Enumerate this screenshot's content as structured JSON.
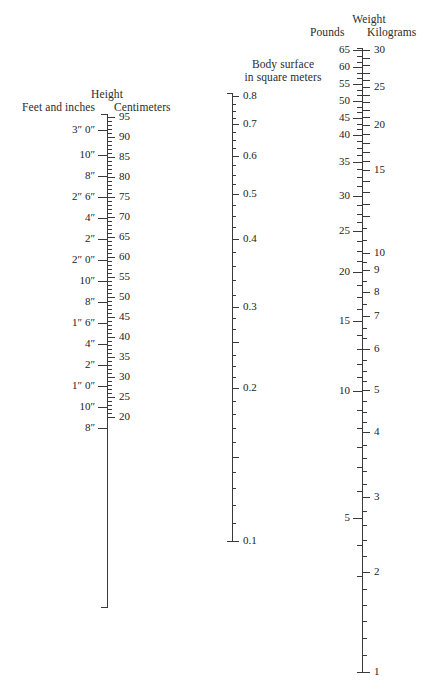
{
  "figure": {
    "kind": "nomogram",
    "name": "body-surface-area-nomogram"
  },
  "height_scale": {
    "title": "Height",
    "left_subtitle": "Feet and inches",
    "right_subtitle": "Centimeters",
    "axis": {
      "x": 107,
      "y_top": 114,
      "y_bottom": 607
    },
    "cm_ticks": [
      {
        "value": "95",
        "y": 117,
        "major": true
      },
      {
        "value": "",
        "y": 121,
        "major": false
      },
      {
        "value": "",
        "y": 125,
        "major": false
      },
      {
        "value": "",
        "y": 129,
        "major": false
      },
      {
        "value": "",
        "y": 133,
        "major": false
      },
      {
        "value": "90",
        "y": 137,
        "major": true
      },
      {
        "value": "",
        "y": 141,
        "major": false
      },
      {
        "value": "",
        "y": 145,
        "major": false
      },
      {
        "value": "",
        "y": 149,
        "major": false
      },
      {
        "value": "",
        "y": 153,
        "major": false
      },
      {
        "value": "85",
        "y": 157,
        "major": true
      },
      {
        "value": "",
        "y": 161,
        "major": false
      },
      {
        "value": "",
        "y": 165,
        "major": false
      },
      {
        "value": "",
        "y": 169,
        "major": false
      },
      {
        "value": "",
        "y": 173,
        "major": false
      },
      {
        "value": "80",
        "y": 177,
        "major": true
      },
      {
        "value": "",
        "y": 181,
        "major": false
      },
      {
        "value": "",
        "y": 185,
        "major": false
      },
      {
        "value": "",
        "y": 189,
        "major": false
      },
      {
        "value": "",
        "y": 193,
        "major": false
      },
      {
        "value": "75",
        "y": 197,
        "major": true
      },
      {
        "value": "",
        "y": 201,
        "major": false
      },
      {
        "value": "",
        "y": 205,
        "major": false
      },
      {
        "value": "",
        "y": 209,
        "major": false
      },
      {
        "value": "",
        "y": 213,
        "major": false
      },
      {
        "value": "70",
        "y": 217,
        "major": true
      },
      {
        "value": "",
        "y": 221,
        "major": false
      },
      {
        "value": "",
        "y": 225,
        "major": false
      },
      {
        "value": "",
        "y": 229,
        "major": false
      },
      {
        "value": "",
        "y": 233,
        "major": false
      },
      {
        "value": "65",
        "y": 237,
        "major": true
      },
      {
        "value": "",
        "y": 241,
        "major": false
      },
      {
        "value": "",
        "y": 245,
        "major": false
      },
      {
        "value": "",
        "y": 249,
        "major": false
      },
      {
        "value": "",
        "y": 253,
        "major": false
      },
      {
        "value": "60",
        "y": 257,
        "major": true
      },
      {
        "value": "",
        "y": 261,
        "major": false
      },
      {
        "value": "",
        "y": 265,
        "major": false
      },
      {
        "value": "",
        "y": 269,
        "major": false
      },
      {
        "value": "",
        "y": 273,
        "major": false
      },
      {
        "value": "55",
        "y": 277,
        "major": true
      },
      {
        "value": "",
        "y": 281,
        "major": false
      },
      {
        "value": "",
        "y": 285,
        "major": false
      },
      {
        "value": "",
        "y": 289,
        "major": false
      },
      {
        "value": "",
        "y": 293,
        "major": false
      },
      {
        "value": "50",
        "y": 297,
        "major": true
      },
      {
        "value": "",
        "y": 301,
        "major": false
      },
      {
        "value": "",
        "y": 305,
        "major": false
      },
      {
        "value": "",
        "y": 309,
        "major": false
      },
      {
        "value": "",
        "y": 313,
        "major": false
      },
      {
        "value": "45",
        "y": 317,
        "major": true
      },
      {
        "value": "",
        "y": 321,
        "major": false
      },
      {
        "value": "",
        "y": 325,
        "major": false
      },
      {
        "value": "",
        "y": 329,
        "major": false
      },
      {
        "value": "",
        "y": 333,
        "major": false
      },
      {
        "value": "40",
        "y": 337,
        "major": true
      },
      {
        "value": "",
        "y": 341,
        "major": false
      },
      {
        "value": "",
        "y": 345,
        "major": false
      },
      {
        "value": "",
        "y": 349,
        "major": false
      },
      {
        "value": "",
        "y": 353,
        "major": false
      },
      {
        "value": "35",
        "y": 357,
        "major": true
      },
      {
        "value": "",
        "y": 361,
        "major": false
      },
      {
        "value": "",
        "y": 365,
        "major": false
      },
      {
        "value": "",
        "y": 369,
        "major": false
      },
      {
        "value": "",
        "y": 373,
        "major": false
      },
      {
        "value": "30",
        "y": 377,
        "major": true
      },
      {
        "value": "",
        "y": 381,
        "major": false
      },
      {
        "value": "",
        "y": 385,
        "major": false
      },
      {
        "value": "",
        "y": 389,
        "major": false
      },
      {
        "value": "",
        "y": 393,
        "major": false
      },
      {
        "value": "25",
        "y": 397,
        "major": true
      },
      {
        "value": "",
        "y": 401,
        "major": false
      },
      {
        "value": "",
        "y": 405,
        "major": false
      },
      {
        "value": "",
        "y": 409,
        "major": false
      },
      {
        "value": "",
        "y": 413,
        "major": false
      },
      {
        "value": "20",
        "y": 417,
        "major": true
      }
    ],
    "ft_ticks": [
      {
        "value": "3″ 0″",
        "y": 130
      },
      {
        "value": "10″",
        "y": 155
      },
      {
        "value": "8″",
        "y": 176
      },
      {
        "value": "2″ 6″",
        "y": 197
      },
      {
        "value": "4″",
        "y": 218
      },
      {
        "value": "2″",
        "y": 239
      },
      {
        "value": "2″ 0″",
        "y": 260
      },
      {
        "value": "10″",
        "y": 281
      },
      {
        "value": "8″",
        "y": 302
      },
      {
        "value": "1″ 6″",
        "y": 323
      },
      {
        "value": "4″",
        "y": 344
      },
      {
        "value": "2″",
        "y": 365
      },
      {
        "value": "1″ 0″",
        "y": 386
      },
      {
        "value": "10″",
        "y": 407
      },
      {
        "value": "8″",
        "y": 428
      }
    ]
  },
  "bsa_scale": {
    "title_line1": "Body surface",
    "title_line2": "in square meters",
    "axis": {
      "x": 232,
      "y_top": 93,
      "y_bottom": 541
    },
    "ticks": [
      {
        "value": "0.8",
        "y": 96,
        "major": true
      },
      {
        "value": "",
        "y": 104,
        "major": false
      },
      {
        "value": "",
        "y": 111,
        "major": false
      },
      {
        "value": "",
        "y": 118,
        "major": false
      },
      {
        "value": "0.7",
        "y": 124,
        "major": true
      },
      {
        "value": "",
        "y": 132,
        "major": false
      },
      {
        "value": "",
        "y": 140,
        "major": false
      },
      {
        "value": "",
        "y": 148,
        "major": false
      },
      {
        "value": "0.6",
        "y": 156,
        "major": true
      },
      {
        "value": "",
        "y": 165,
        "major": false
      },
      {
        "value": "",
        "y": 175,
        "major": false
      },
      {
        "value": "",
        "y": 184,
        "major": false
      },
      {
        "value": "0.5",
        "y": 194,
        "major": true
      },
      {
        "value": "",
        "y": 205,
        "major": false
      },
      {
        "value": "",
        "y": 216,
        "major": false
      },
      {
        "value": "",
        "y": 227,
        "major": false
      },
      {
        "value": "0.4",
        "y": 239,
        "major": true
      },
      {
        "value": "",
        "y": 252,
        "major": false
      },
      {
        "value": "",
        "y": 266,
        "major": false
      },
      {
        "value": "",
        "y": 280,
        "major": false
      },
      {
        "value": "",
        "y": 295,
        "major": false
      },
      {
        "value": "0.3",
        "y": 307,
        "major": true
      },
      {
        "value": "",
        "y": 318,
        "major": false
      },
      {
        "value": "",
        "y": 329,
        "major": false
      },
      {
        "value": "",
        "y": 342,
        "major": true
      },
      {
        "value": "",
        "y": 355,
        "major": false
      },
      {
        "value": "",
        "y": 366,
        "major": false
      },
      {
        "value": "",
        "y": 377,
        "major": false
      },
      {
        "value": "0.2",
        "y": 388,
        "major": true
      },
      {
        "value": "",
        "y": 401,
        "major": false
      },
      {
        "value": "",
        "y": 414,
        "major": false
      },
      {
        "value": "",
        "y": 428,
        "major": false
      },
      {
        "value": "",
        "y": 442,
        "major": false
      },
      {
        "value": "",
        "y": 457,
        "major": true
      },
      {
        "value": "",
        "y": 472,
        "major": false
      },
      {
        "value": "",
        "y": 488,
        "major": false
      },
      {
        "value": "",
        "y": 505,
        "major": false
      },
      {
        "value": "",
        "y": 523,
        "major": false
      },
      {
        "value": "0.1",
        "y": 541,
        "major": true
      }
    ]
  },
  "weight_scale": {
    "title": "Weight",
    "left_subtitle": "Pounds",
    "right_subtitle": "Kilograms",
    "axis": {
      "x": 362,
      "y_top": 48,
      "y_bottom": 672
    },
    "kg_ticks": [
      {
        "value": "30",
        "y": 50,
        "major": true
      },
      {
        "value": "",
        "y": 58,
        "major": false
      },
      {
        "value": "",
        "y": 65,
        "major": false
      },
      {
        "value": "",
        "y": 73,
        "major": false
      },
      {
        "value": "",
        "y": 80,
        "major": false
      },
      {
        "value": "25",
        "y": 87,
        "major": true
      },
      {
        "value": "",
        "y": 95,
        "major": false
      },
      {
        "value": "",
        "y": 102,
        "major": false
      },
      {
        "value": "",
        "y": 110,
        "major": false
      },
      {
        "value": "",
        "y": 117,
        "major": false
      },
      {
        "value": "20",
        "y": 125,
        "major": true
      },
      {
        "value": "",
        "y": 134,
        "major": false
      },
      {
        "value": "",
        "y": 143,
        "major": false
      },
      {
        "value": "",
        "y": 152,
        "major": false
      },
      {
        "value": "",
        "y": 161,
        "major": false
      },
      {
        "value": "15",
        "y": 170,
        "major": true
      },
      {
        "value": "",
        "y": 181,
        "major": false
      },
      {
        "value": "",
        "y": 192,
        "major": false
      },
      {
        "value": "",
        "y": 204,
        "major": false
      },
      {
        "value": "",
        "y": 216,
        "major": false
      },
      {
        "value": "10",
        "y": 253,
        "major": true
      },
      {
        "value": "9",
        "y": 270,
        "major": true
      },
      {
        "value": "8",
        "y": 292,
        "major": true
      },
      {
        "value": "7",
        "y": 316,
        "major": true
      },
      {
        "value": "6",
        "y": 349,
        "major": true
      },
      {
        "value": "5",
        "y": 390,
        "major": true
      },
      {
        "value": "4",
        "y": 432,
        "major": true
      },
      {
        "value": "3",
        "y": 497,
        "major": true
      },
      {
        "value": "2",
        "y": 572,
        "major": true
      },
      {
        "value": "1",
        "y": 672,
        "major": true
      }
    ],
    "kg_minor_ticks": [
      {
        "y": 228
      },
      {
        "y": 240
      },
      {
        "y": 262
      },
      {
        "y": 281
      },
      {
        "y": 304
      },
      {
        "y": 328
      },
      {
        "y": 338
      },
      {
        "y": 360
      },
      {
        "y": 371
      },
      {
        "y": 381
      },
      {
        "y": 401
      },
      {
        "y": 412
      },
      {
        "y": 422
      },
      {
        "y": 445
      },
      {
        "y": 458
      },
      {
        "y": 471
      },
      {
        "y": 484
      },
      {
        "y": 511
      },
      {
        "y": 525
      },
      {
        "y": 540
      },
      {
        "y": 556
      },
      {
        "y": 589
      },
      {
        "y": 605
      },
      {
        "y": 621
      },
      {
        "y": 638
      },
      {
        "y": 655
      }
    ],
    "lb_ticks": [
      {
        "value": "65",
        "y": 50
      },
      {
        "value": "60",
        "y": 67
      },
      {
        "value": "55",
        "y": 84
      },
      {
        "value": "50",
        "y": 101
      },
      {
        "value": "45",
        "y": 118
      },
      {
        "value": "40",
        "y": 135
      },
      {
        "value": "35",
        "y": 162
      },
      {
        "value": "30",
        "y": 196
      },
      {
        "value": "25",
        "y": 231
      },
      {
        "value": "20",
        "y": 272
      },
      {
        "value": "15",
        "y": 321
      },
      {
        "value": "10",
        "y": 391
      },
      {
        "value": "5",
        "y": 518
      }
    ],
    "lb_minor_ticks": [
      {
        "y": 56
      },
      {
        "y": 62
      },
      {
        "y": 73
      },
      {
        "y": 78
      },
      {
        "y": 90
      },
      {
        "y": 95
      },
      {
        "y": 107
      },
      {
        "y": 112
      },
      {
        "y": 124
      },
      {
        "y": 129
      },
      {
        "y": 141
      },
      {
        "y": 148
      },
      {
        "y": 155
      },
      {
        "y": 169
      },
      {
        "y": 177
      },
      {
        "y": 186
      },
      {
        "y": 205
      },
      {
        "y": 214
      },
      {
        "y": 222
      },
      {
        "y": 241
      },
      {
        "y": 251
      },
      {
        "y": 261
      },
      {
        "y": 285
      },
      {
        "y": 297
      },
      {
        "y": 309
      },
      {
        "y": 335
      },
      {
        "y": 349
      },
      {
        "y": 364
      },
      {
        "y": 377
      },
      {
        "y": 410
      },
      {
        "y": 428
      },
      {
        "y": 447
      },
      {
        "y": 467
      },
      {
        "y": 491
      },
      {
        "y": 545
      },
      {
        "y": 576
      }
    ]
  }
}
